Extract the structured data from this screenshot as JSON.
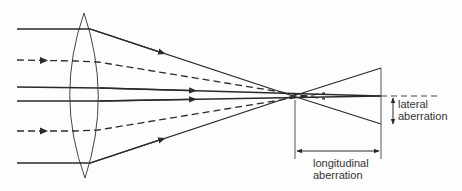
{
  "diagram": {
    "labels": {
      "lateral_line1": "lateral",
      "lateral_line2": "aberration",
      "longitudinal_line1": "longitudinal",
      "longitudinal_line2": "aberration"
    },
    "colors": {
      "line": "#2a2a2a",
      "background": "#fdfdfd",
      "text": "#333333"
    }
  }
}
